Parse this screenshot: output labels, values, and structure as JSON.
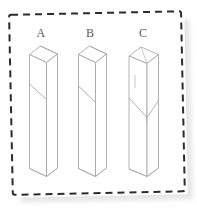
{
  "figure": {
    "title": "",
    "background_color": "#ffffff",
    "border": {
      "style": "dashed",
      "color": "#2b2b2b",
      "width": 2,
      "dash": "7 5",
      "rotation_deg": -1.2,
      "shadow_color": "#e3e3e3"
    },
    "label_color": "#5a5a5a",
    "line_color": "#9a9a9a",
    "face_fill": "#ffffff"
  },
  "columns": [
    {
      "id": "A",
      "label": "A",
      "label_x": 41,
      "label_y": 37,
      "cut_type": "single-diagonal-notch",
      "cut_description": "angled top face with a short diagonal kerf cut on the front face",
      "top_cut_angle": "bevel",
      "notch_y": 90
    },
    {
      "id": "B",
      "label": "B",
      "label_x": 90,
      "label_y": 37,
      "cut_type": "single-diagonal-notch",
      "cut_description": "angled top face with a longer diagonal kerf cut on the front face",
      "top_cut_angle": "bevel",
      "notch_y": 93
    },
    {
      "id": "C",
      "label": "C",
      "label_x": 143,
      "label_y": 37,
      "cut_type": "v-chevron-notch",
      "cut_description": "open top with a V-shaped chevron cut across both visible faces",
      "top_cut_angle": "flat-open",
      "notch_y": 104
    }
  ],
  "geometry": {
    "column_width": 18,
    "depth_x": 11,
    "depth_y": 9,
    "body_bottom_y": 176,
    "body_top_y": 55
  }
}
